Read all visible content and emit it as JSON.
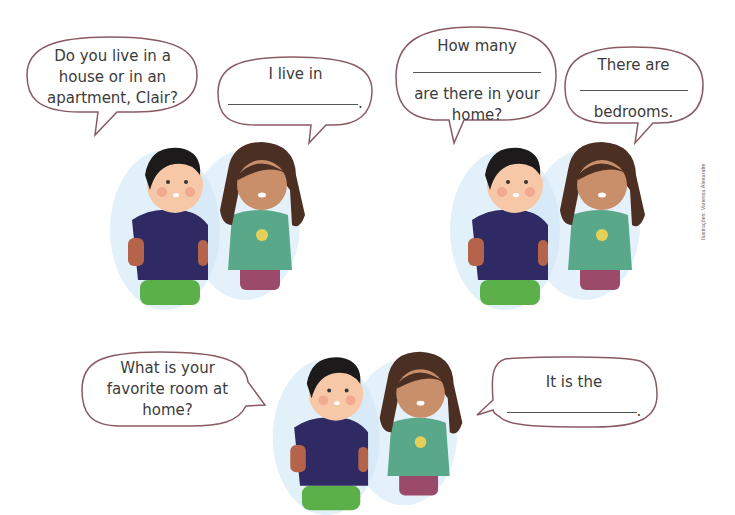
{
  "dialogues": [
    {
      "question": {
        "lines": [
          "Do you live in a",
          "house or in an",
          "apartment, Clair?"
        ]
      },
      "answer": {
        "before_blank": "I live in",
        "after_blank": "."
      }
    },
    {
      "question": {
        "before_blank": "How many",
        "after_blank_lines": [
          "are there in your",
          "home?"
        ]
      },
      "answer": {
        "before_blank": "There are",
        "after_blank": "bedrooms."
      }
    },
    {
      "question": {
        "lines": [
          "What is your",
          "favorite room at",
          "home?"
        ]
      },
      "answer": {
        "before_blank": "It is the",
        "after_blank": "."
      }
    }
  ],
  "credit": "Ilustrações: Vanessa Alexandre",
  "colors": {
    "bubble_stroke": "#8a5a62",
    "boy_shirt": "#2f2a63",
    "boy_pants": "#5bb04a",
    "girl_shirt": "#5aa88a",
    "girl_pants": "#9b4a6a",
    "hair_boy": "#1c1a1a",
    "hair_girl": "#4a2f22",
    "halo": "#cfe6f5"
  }
}
